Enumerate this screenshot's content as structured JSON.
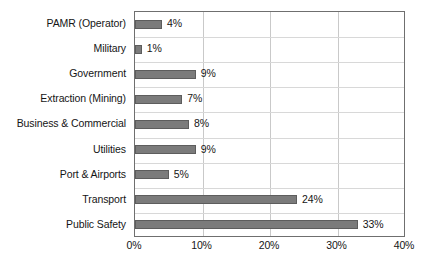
{
  "chart_data": {
    "type": "bar",
    "orientation": "horizontal",
    "title": "",
    "subtitle": "",
    "xlabel": "",
    "ylabel": "",
    "xlim": [
      0,
      40
    ],
    "grid": true,
    "legend": null,
    "legend_position": "none",
    "value_suffix": "%",
    "categories": [
      "PAMR (Operator)",
      "Military",
      "Government",
      "Extraction (Mining)",
      "Business & Commercial",
      "Utilities",
      "Port & Airports",
      "Transport",
      "Public Safety"
    ],
    "values": [
      4,
      1,
      9,
      7,
      8,
      9,
      5,
      24,
      33
    ],
    "data_labels": [
      "4%",
      "1%",
      "9%",
      "7%",
      "8%",
      "9%",
      "5%",
      "24%",
      "33%"
    ],
    "xticks": [
      0,
      10,
      20,
      30,
      40
    ],
    "xtick_labels": [
      "0%",
      "10%",
      "20%",
      "30%",
      "40%"
    ],
    "colors": {
      "bar_fill": "#7b7b7b",
      "bar_border": "#5d5d5d",
      "plot_border": "#6f6f6f",
      "gridline": "#c9c9c9",
      "text": "#151515",
      "background": "#ffffff"
    }
  }
}
